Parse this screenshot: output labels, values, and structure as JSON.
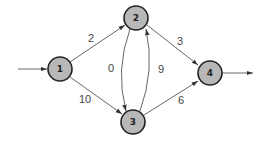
{
  "diagram": {
    "type": "weighted-directed-graph",
    "nodes": [
      {
        "id": "1",
        "label": "1",
        "x": 60,
        "y": 69
      },
      {
        "id": "2",
        "label": "2",
        "x": 136,
        "y": 18
      },
      {
        "id": "3",
        "label": "3",
        "x": 133,
        "y": 122
      },
      {
        "id": "4",
        "label": "4",
        "x": 210,
        "y": 73
      }
    ],
    "edges": [
      {
        "from": "1",
        "to": "2",
        "weight": "2"
      },
      {
        "from": "1",
        "to": "3",
        "weight": "10"
      },
      {
        "from": "2",
        "to": "3",
        "weight": "0"
      },
      {
        "from": "3",
        "to": "2",
        "weight": "9"
      },
      {
        "from": "2",
        "to": "4",
        "weight": "3"
      },
      {
        "from": "3",
        "to": "4",
        "weight": "6"
      }
    ],
    "source_arrow": {
      "into": "1"
    },
    "sink_arrow": {
      "out_of": "4"
    },
    "colors": {
      "node_fill": "#b8b8b8",
      "node_stroke": "#222222",
      "edge": "#555555"
    }
  }
}
